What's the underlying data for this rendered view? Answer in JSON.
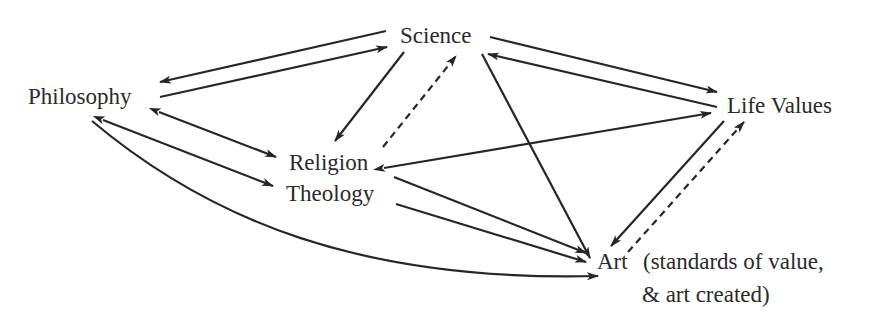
{
  "diagram": {
    "type": "concept-relationship-diagram",
    "colors": {
      "background": "#ffffff",
      "ink": "#262626",
      "text": "#2a2a2a"
    },
    "nodes": {
      "science": {
        "label": "Science"
      },
      "philosophy": {
        "label": "Philosophy"
      },
      "life_values": {
        "label": "Life Values"
      },
      "religion": {
        "label": "Religion"
      },
      "theology": {
        "label": "Theology"
      },
      "art": {
        "label": "Art",
        "note_line1": "(standards of value,",
        "note_line2": "& art created)"
      }
    },
    "edges": [
      {
        "from": "Science",
        "to": "Philosophy",
        "style": "solid",
        "heads": "end"
      },
      {
        "from": "Philosophy",
        "to": "Science",
        "style": "solid",
        "heads": "end"
      },
      {
        "from": "Science",
        "to": "Religion",
        "style": "solid",
        "heads": "end"
      },
      {
        "from": "Religion",
        "to": "Science",
        "style": "dashed",
        "heads": "end"
      },
      {
        "from": "Science",
        "to": "Life Values",
        "style": "solid",
        "heads": "end"
      },
      {
        "from": "Life Values",
        "to": "Science",
        "style": "solid",
        "heads": "end"
      },
      {
        "from": "Science",
        "to": "Art",
        "style": "solid",
        "heads": "end"
      },
      {
        "from": "Philosophy",
        "to": "Religion",
        "style": "solid",
        "heads": "both"
      },
      {
        "from": "Philosophy",
        "to": "Theology",
        "style": "solid",
        "heads": "both"
      },
      {
        "from": "Philosophy",
        "to": "Art",
        "style": "solid-curve",
        "heads": "end"
      },
      {
        "from": "Religion",
        "to": "Life Values",
        "style": "solid",
        "heads": "both"
      },
      {
        "from": "Religion",
        "to": "Art",
        "style": "solid",
        "heads": "end"
      },
      {
        "from": "Theology",
        "to": "Art",
        "style": "solid",
        "heads": "end"
      },
      {
        "from": "Life Values",
        "to": "Art",
        "style": "solid",
        "heads": "end"
      },
      {
        "from": "Art",
        "to": "Life Values",
        "style": "dashed",
        "heads": "end"
      }
    ]
  }
}
